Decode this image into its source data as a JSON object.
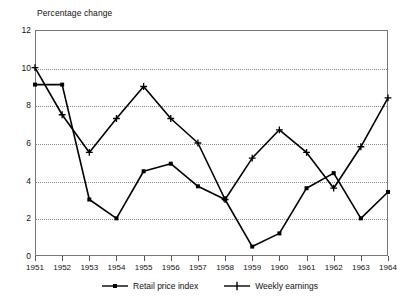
{
  "chart_data": {
    "type": "line",
    "title": "",
    "ylabel": "Percentage change",
    "xlabel": "",
    "categories": [
      "1951",
      "1952",
      "1953",
      "1954",
      "1955",
      "1956",
      "1957",
      "1958",
      "1959",
      "1960",
      "1961",
      "1962",
      "1963",
      "1964"
    ],
    "ylim": [
      0,
      12
    ],
    "yticks": [
      0,
      2,
      4,
      6,
      8,
      10,
      12
    ],
    "grid": true,
    "legend_position": "bottom",
    "series": [
      {
        "name": "Retail price index",
        "marker": "square",
        "color": "#000000",
        "values": [
          9.1,
          9.1,
          3.0,
          2.0,
          4.5,
          4.9,
          3.7,
          3.0,
          0.5,
          1.2,
          3.6,
          4.4,
          2.0,
          3.4
        ]
      },
      {
        "name": "Weekly earnings",
        "marker": "plus",
        "color": "#000000",
        "values": [
          10.0,
          7.5,
          5.5,
          7.3,
          9.0,
          7.3,
          6.0,
          3.0,
          5.2,
          6.7,
          5.5,
          3.6,
          5.8,
          8.4
        ]
      }
    ]
  },
  "colors": {
    "frame": "#777777",
    "grid": "#8a8a8a",
    "series": "#000000",
    "background": "#ffffff"
  }
}
